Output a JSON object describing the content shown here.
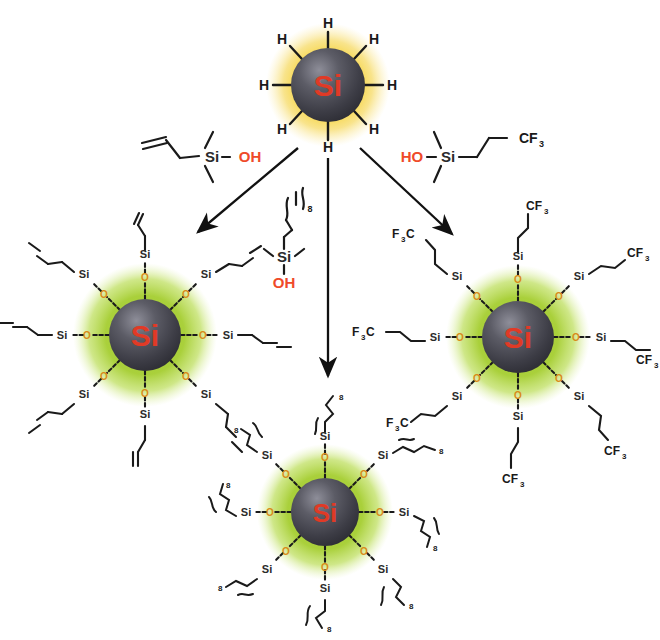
{
  "figure": {
    "background_color": "#ffffff",
    "core_label": "Si",
    "core_label_color": "#e03a26",
    "core_fill_dark": "#3c3c44",
    "core_fill_light": "#7a7a84",
    "halo_yellow": "#f5cf3c",
    "halo_green": "#a9cf35",
    "oxygen_color": "#d98b18",
    "bond_color": "#1a1a1a"
  },
  "reactant": {
    "name": "hydride-terminated-silicon-nanoparticle",
    "core_label": "Si",
    "halo_color": "#f5cf3c",
    "terminus_label": "H",
    "terminus_count": 8,
    "center": {
      "x": 328,
      "y": 85
    },
    "core_radius": 37,
    "halo_radius": 60
  },
  "reagents": [
    {
      "id": "reagent-allyl-silanol",
      "position": "left",
      "formula_parts": {
        "chain": "allyl (CH2=CH-CH2-)",
        "si": "Si",
        "oh": "OH"
      },
      "si_label": "Si",
      "oh_label": "OH",
      "terminus_label": "",
      "description": "allyldimethylsilanol"
    },
    {
      "id": "reagent-octyl-silanol",
      "position": "center",
      "formula_parts": {
        "chain": "alkyl repeat",
        "si": "Si",
        "oh": "OH"
      },
      "si_label": "Si",
      "oh_label": "OH",
      "repeat_subscript": "8",
      "description": "alkyl(n=8)dimethylsilanol"
    },
    {
      "id": "reagent-trifluoropropyl-silanol",
      "position": "right",
      "formula_parts": {
        "oh": "HO",
        "si": "Si",
        "chain": "propyl",
        "terminus": "CF"
      },
      "oh_label": "HO",
      "si_label": "Si",
      "terminus_label": "CF",
      "terminus_subscript": "3",
      "description": "3,3,3-trifluoropropyldimethylsilanol"
    }
  ],
  "arrows": [
    {
      "id": "arrow-left",
      "from": {
        "x": 296,
        "y": 146
      },
      "to": {
        "x": 197,
        "y": 233
      }
    },
    {
      "id": "arrow-center",
      "from": {
        "x": 328,
        "y": 152
      },
      "to": {
        "x": 328,
        "y": 378
      }
    },
    {
      "id": "arrow-right",
      "from": {
        "x": 362,
        "y": 146
      },
      "to": {
        "x": 452,
        "y": 236
      }
    }
  ],
  "products": [
    {
      "id": "product-allyl-functionalized",
      "position": "left",
      "center": {
        "x": 145,
        "y": 335
      },
      "core_radius": 36,
      "halo_radius": 70,
      "core_label": "Si",
      "halo_color": "#a9cf35",
      "bridge_label": "O",
      "shell_label": "Si",
      "arm_count": 8,
      "terminus_label": "",
      "terminus_type": "vinyl double bond",
      "description": "allyl-terminated siloxane shell"
    },
    {
      "id": "product-alkyl-functionalized",
      "position": "bottom",
      "center": {
        "x": 325,
        "y": 512
      },
      "core_radius": 34,
      "halo_radius": 66,
      "core_label": "Si",
      "halo_color": "#a9cf35",
      "bridge_label": "O",
      "shell_label": "Si",
      "arm_count": 8,
      "terminus_label": "",
      "repeat_subscript": "8",
      "terminus_type": "alkyl chain with repeat bracket",
      "description": "alkyl-terminated siloxane shell"
    },
    {
      "id": "product-trifluoropropyl-functionalized",
      "position": "right",
      "center": {
        "x": 518,
        "y": 337
      },
      "core_radius": 36,
      "halo_radius": 70,
      "core_label": "Si",
      "halo_color": "#a9cf35",
      "bridge_label": "O",
      "shell_label": "Si",
      "arm_count": 8,
      "terminus_label_right": "CF",
      "terminus_label_left": "F",
      "terminus_label_left_tail": "C",
      "terminus_subscript": "3",
      "description": "trifluoropropyl-terminated siloxane shell"
    }
  ],
  "labels": {
    "hydrogen": "H",
    "silicon": "Si",
    "oxygen": "O",
    "hydroxyl": "OH",
    "hydroxyl_reversed": "HO",
    "trifluoromethyl": "CF",
    "trifluoromethyl_reversed_head": "F",
    "trifluoromethyl_reversed_tail": "C",
    "subscript_three": "3",
    "subscript_eight": "8"
  }
}
